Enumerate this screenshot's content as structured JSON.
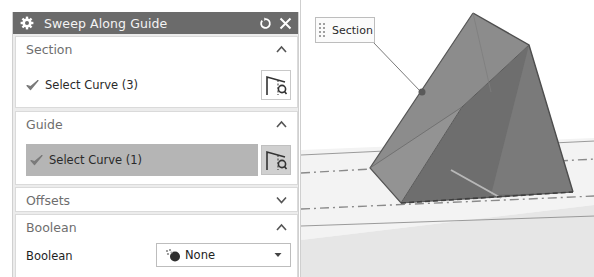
{
  "dialog": {
    "title": "Sweep Along Guide",
    "icons": {
      "title": "gear-icon",
      "reset": "reset-icon",
      "close": "close-icon"
    },
    "groups": [
      {
        "header": "Section",
        "expanded": true,
        "chevron": "chevron-up-icon",
        "select_label": "Select Curve (3)",
        "select_icon": "curve-select-icon",
        "status_icon": "checkmark-icon",
        "highlighted": false
      },
      {
        "header": "Guide",
        "expanded": true,
        "chevron": "chevron-up-icon",
        "select_label": "Select Curve (1)",
        "select_icon": "curve-select-icon",
        "status_icon": "checkmark-icon",
        "highlighted": true
      },
      {
        "header": "Offsets",
        "expanded": false,
        "chevron": "chevron-down-icon"
      },
      {
        "header": "Boolean",
        "expanded": true,
        "chevron": "chevron-up-icon",
        "field_label": "Boolean",
        "dropdown_value": "None",
        "dropdown_icon": "boolean-none-icon"
      }
    ]
  },
  "viewport": {
    "callout_label": "Section",
    "colors": {
      "prism_left_face": "#8a8a8a",
      "prism_right_face": "#6d6d6d",
      "ground": "#f2f2f2",
      "highlight_row": "#b5b5b5",
      "title_bar": "#6b6b6b"
    }
  }
}
